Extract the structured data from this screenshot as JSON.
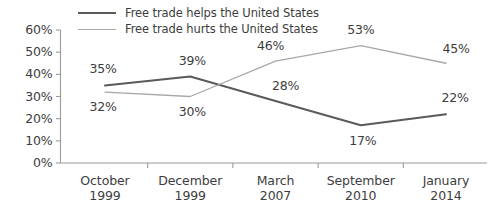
{
  "chart_data": {
    "type": "line",
    "title": "",
    "xlabel": "",
    "ylabel": "",
    "ylim": [
      0,
      60
    ],
    "grid": false,
    "legend_position": "top",
    "categories": [
      "October 1999",
      "December 1999",
      "March 2007",
      "September 2010",
      "January 2014"
    ],
    "category_lines": [
      [
        "October",
        "1999"
      ],
      [
        "December",
        "1999"
      ],
      [
        "March",
        "2007"
      ],
      [
        "September",
        "2010"
      ],
      [
        "January",
        "2014"
      ]
    ],
    "ytick_labels": [
      "60%",
      "50%",
      "40%",
      "30%",
      "20%",
      "10%",
      "0%"
    ],
    "ytick_values": [
      60,
      50,
      40,
      30,
      20,
      10,
      0
    ],
    "series": [
      {
        "name": "Free trade helps the United States",
        "color": "#5a5a5a",
        "values": [
          35,
          39,
          28,
          17,
          22
        ],
        "value_labels": [
          "35%",
          "39%",
          "28%",
          "17%",
          "22%"
        ]
      },
      {
        "name": "Free trade hurts the United States",
        "color": "#a8a8a8",
        "values": [
          32,
          30,
          46,
          53,
          45
        ],
        "value_labels": [
          "32%",
          "30%",
          "46%",
          "53%",
          "45%"
        ]
      }
    ]
  },
  "colors": {
    "background": "#ffffff",
    "text": "#3d3d3d",
    "axis": "#9a9a9a",
    "series_helps": "#5a5a5a",
    "series_hurts": "#a8a8a8"
  }
}
